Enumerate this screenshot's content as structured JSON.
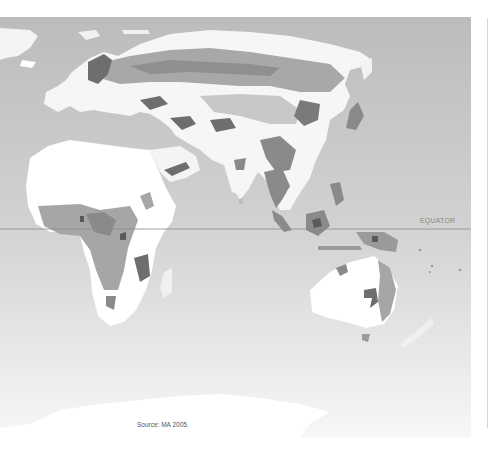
{
  "map": {
    "title": "Eastern Hemisphere land cover map",
    "equator_label": "EQUATOR",
    "source": "Source: MA 2005.",
    "colors": {
      "ocean_top": "#bdbdbd",
      "ocean_bottom": "#f4f4f4",
      "land_light": "#ffffff",
      "land_mid": "#a6a6a6",
      "land_dark": "#6e6e6e",
      "equator_line": "#8c8c8c",
      "background": "#ffffff"
    },
    "regions": [
      "Europe",
      "Africa",
      "Middle East",
      "Asia",
      "India",
      "Southeast Asia",
      "Australia",
      "New Zealand",
      "Antarctica"
    ]
  }
}
